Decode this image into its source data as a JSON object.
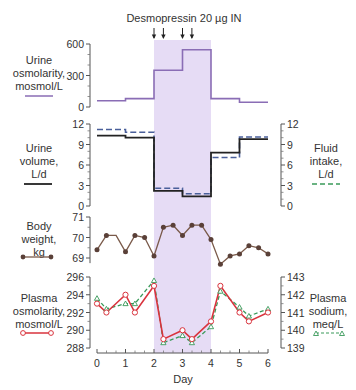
{
  "chart_data": [
    {
      "type": "line",
      "title": "Desmopressin 20 µg IN",
      "annotation": {
        "text": "Desmopressin 20 µg IN",
        "dose_days": [
          2.0,
          2.33,
          3.0,
          3.33
        ]
      },
      "shaded_region_days": [
        2,
        4
      ],
      "shade_color": "#e6dcf5",
      "panel": "urine-osmolarity",
      "ylabel": "Urine osmolarity, mosmol/L",
      "ylim": [
        0,
        600
      ],
      "yticks": [
        "0",
        "300",
        "600"
      ],
      "series": [
        {
          "name": "Urine osmolarity",
          "color": "#8a6db5",
          "style": "step",
          "x": [
            0,
            1,
            2,
            3,
            4,
            5,
            6
          ],
          "values": [
            60,
            80,
            350,
            545,
            80,
            45
          ]
        }
      ]
    },
    {
      "type": "line",
      "panel": "urine-volume",
      "ylabel": "Urine volume, L/d",
      "ylabel_right": "Fluid intake, L/d",
      "ylim": [
        0,
        12
      ],
      "yticks": [
        "0",
        "3",
        "6",
        "9",
        "12"
      ],
      "series": [
        {
          "name": "Urine volume",
          "color": "#222222",
          "style": "step",
          "x": [
            0,
            1,
            2,
            3,
            4,
            5,
            6
          ],
          "values": [
            10.3,
            10.0,
            2.2,
            1.4,
            7.8,
            9.8
          ]
        },
        {
          "name": "Fluid intake",
          "color": "#4a5f9a",
          "legend_color": "#3a9a5a",
          "style": "step-dashed",
          "x": [
            0,
            1,
            2,
            3,
            4,
            5,
            6
          ],
          "values": [
            11.2,
            10.8,
            2.6,
            1.8,
            7.1,
            10.1
          ]
        }
      ]
    },
    {
      "type": "line",
      "panel": "body-weight",
      "ylabel": "Body weight, kg",
      "ylim": [
        68.7,
        71
      ],
      "yticks": [
        "69",
        "70",
        "71"
      ],
      "series": [
        {
          "name": "Body weight",
          "color": "#6b4a3a",
          "marker": "filled-circle",
          "x": [
            0,
            0.33,
            0.67,
            1,
            1.33,
            1.67,
            2,
            2.33,
            2.67,
            3,
            3.33,
            3.67,
            4,
            4.33,
            4.67,
            5,
            5.33,
            5.67,
            6
          ],
          "values": [
            69.4,
            70.1,
            70.1,
            69.3,
            70.1,
            70.0,
            69.1,
            70.5,
            70.6,
            70.1,
            70.6,
            70.6,
            69.9,
            68.7,
            69.1,
            69.2,
            69.6,
            69.5,
            69.2
          ],
          "markers_on": [
            true,
            true,
            false,
            true,
            true,
            true,
            true,
            true,
            true,
            true,
            true,
            true,
            true,
            true,
            true,
            true,
            true,
            true,
            true
          ]
        }
      ]
    },
    {
      "type": "line",
      "panel": "plasma",
      "ylabel": "Plasma osmolarity, mosmol/L",
      "ylabel_right": "Plasma sodium, meq/L",
      "ylim": [
        288,
        296
      ],
      "yticks": [
        "288",
        "290",
        "292",
        "294",
        "296"
      ],
      "ylim_right": [
        139,
        143
      ],
      "yticks_right": [
        "139",
        "140",
        "141",
        "142",
        "143"
      ],
      "xlabel": "Day",
      "xlim": [
        0,
        6
      ],
      "xticks": [
        "0",
        "1",
        "2",
        "3",
        "4",
        "5",
        "6"
      ],
      "series": [
        {
          "name": "Plasma osmolarity",
          "color": "#d9333d",
          "marker": "open-circle",
          "axis": "left",
          "x": [
            0,
            0.33,
            1,
            1.33,
            2,
            2.33,
            3,
            3.33,
            4,
            4.33,
            5,
            5.33,
            6
          ],
          "values": [
            293,
            292,
            294,
            292,
            295,
            289,
            290,
            289,
            291,
            295,
            292,
            291,
            292
          ]
        },
        {
          "name": "Plasma sodium",
          "color": "#3a9a5a",
          "marker": "open-triangle",
          "style": "dashed",
          "axis": "right",
          "x": [
            0,
            0.33,
            1,
            1.33,
            2,
            2.33,
            3,
            3.33,
            4,
            4.33,
            5,
            5.33,
            6
          ],
          "values": [
            141.8,
            141.2,
            141.5,
            141.5,
            142.8,
            139.3,
            139.7,
            139.3,
            140.2,
            142.2,
            141.3,
            140.8,
            141.2
          ]
        }
      ]
    }
  ],
  "labels": {
    "title": "Desmopressin 20 µg IN",
    "urine_osm": [
      "Urine",
      "osmolarity,",
      "mosmol/L"
    ],
    "urine_vol": [
      "Urine",
      "volume,",
      "L/d"
    ],
    "fluid_intake": [
      "Fluid",
      "intake,",
      "L/d"
    ],
    "body_weight": [
      "Body",
      "weight,",
      "kg"
    ],
    "plasma_osm": [
      "Plasma",
      "osmolarity,",
      "mosmol/L"
    ],
    "plasma_na": [
      "Plasma",
      "sodium,",
      "meq/L"
    ],
    "xlabel": "Day"
  }
}
